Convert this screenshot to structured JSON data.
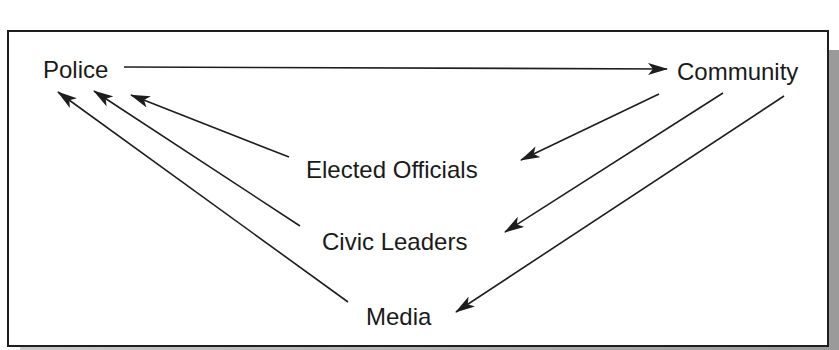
{
  "diagram": {
    "nodes": {
      "police": "Police",
      "community": "Community",
      "elected_officials": "Elected Officials",
      "civic_leaders": "Civic Leaders",
      "media": "Media"
    },
    "edges": [
      {
        "from": "Police",
        "to": "Community"
      },
      {
        "from": "Community",
        "to": "Elected Officials"
      },
      {
        "from": "Community",
        "to": "Civic Leaders"
      },
      {
        "from": "Community",
        "to": "Media"
      },
      {
        "from": "Elected Officials",
        "to": "Police"
      },
      {
        "from": "Civic Leaders",
        "to": "Police"
      },
      {
        "from": "Media",
        "to": "Police"
      }
    ],
    "colors": {
      "line": "#1e1e1e",
      "text": "#1a1a1a",
      "shadow": "#9a9a9a",
      "background": "#ffffff"
    }
  }
}
